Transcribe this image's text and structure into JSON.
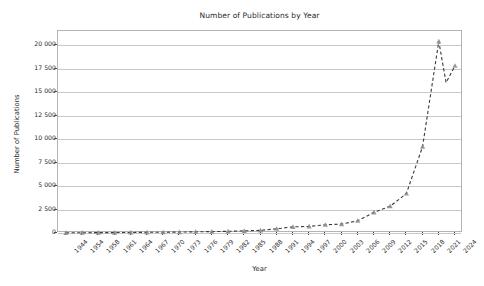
{
  "chart_data": {
    "type": "line",
    "title": "Number of Publications by Year",
    "xlabel": "Year",
    "ylabel": "Number of Publications",
    "grid": "horizontal",
    "legend": "none",
    "line_style": "dashed",
    "marker": "triangle-up",
    "line_color": "#3a3a3a",
    "marker_color": "#8a8a8a",
    "grid_color": "#c8c8c8",
    "ylim": [
      0,
      21500
    ],
    "y_ticks": [
      0,
      2500,
      5000,
      7500,
      10000,
      12500,
      15000,
      17500,
      20000
    ],
    "y_tick_labels": [
      "0",
      "2 500",
      "5 000",
      "7 500",
      "10 000",
      "12 500",
      "15 000",
      "17 500",
      "20 000"
    ],
    "x_tick_labels": [
      "1944",
      "1954",
      "1958",
      "1961",
      "1964",
      "1967",
      "1970",
      "1973",
      "1976",
      "1979",
      "1982",
      "1985",
      "1988",
      "1991",
      "1994",
      "1997",
      "2000",
      "2003",
      "2006",
      "2009",
      "2012",
      "2015",
      "2018",
      "2021",
      "2024"
    ],
    "categories": [
      "1944",
      "1954",
      "1958",
      "1961",
      "1964",
      "1967",
      "1970",
      "1973",
      "1976",
      "1979",
      "1982",
      "1985",
      "1988",
      "1991",
      "1994",
      "1997",
      "2000",
      "2003",
      "2006",
      "2009",
      "2012",
      "2015",
      "2018",
      "2021",
      "2024"
    ],
    "values": [
      20,
      30,
      40,
      45,
      60,
      70,
      80,
      100,
      130,
      150,
      180,
      230,
      280,
      450,
      650,
      700,
      880,
      950,
      1300,
      2200,
      2850,
      4200,
      9200,
      20400,
      17800
    ],
    "series": [
      {
        "name": "Publications",
        "values": [
          20,
          30,
          40,
          45,
          60,
          70,
          80,
          100,
          130,
          150,
          180,
          230,
          280,
          450,
          650,
          700,
          880,
          950,
          1300,
          2200,
          2850,
          4200,
          9200,
          20400,
          17800
        ]
      }
    ],
    "interior_points": [
      {
        "x": "2022",
        "y": 16000
      }
    ],
    "annotations": []
  }
}
